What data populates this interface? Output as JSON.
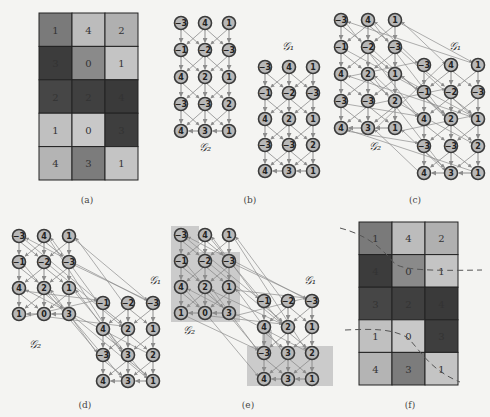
{
  "figure": {
    "captions": [
      "(a)",
      "(b)",
      "(c)",
      "(d)",
      "(e)",
      "(f)"
    ],
    "graph_labels": {
      "g1": "𝒢₁",
      "g2": "𝒢₂"
    }
  },
  "panel_a": {
    "caption": "(a)",
    "grid": [
      [
        1,
        4,
        2
      ],
      [
        3,
        0,
        1
      ],
      [
        2,
        2,
        4
      ],
      [
        1,
        0,
        3
      ],
      [
        4,
        3,
        1
      ]
    ],
    "shades": [
      [
        "#7a7a7a",
        "#bcbcbc",
        "#b0b0b0"
      ],
      [
        "#3c3c3c",
        "#8a8a8a",
        "#c4c4c4"
      ],
      [
        "#464646",
        "#404040",
        "#3a3a3a"
      ],
      [
        "#c0c0c0",
        "#c8c8c8",
        "#3e3e3e"
      ],
      [
        "#b4b4b4",
        "#7c7c7c",
        "#c4c4c4"
      ]
    ]
  },
  "panel_b": {
    "caption": "(b)",
    "g2_nodes": [
      [
        "-3",
        "4",
        "1"
      ],
      [
        "-1",
        "-2",
        "-3"
      ],
      [
        "4",
        "2",
        "1"
      ],
      [
        "-3",
        "-3",
        "2"
      ],
      [
        "4",
        "3",
        "1"
      ]
    ],
    "g1_nodes": [
      [
        "-3",
        "4",
        "1"
      ],
      [
        "-1",
        "-2",
        "-3"
      ],
      [
        "4",
        "2",
        "1"
      ],
      [
        "-3",
        "-3",
        "2"
      ],
      [
        "4",
        "3",
        "1"
      ]
    ]
  },
  "panel_c": {
    "caption": "(c)",
    "g2_nodes": [
      [
        "-3",
        "4",
        "1"
      ],
      [
        "-1",
        "-2",
        "-3"
      ],
      [
        "4",
        "2",
        "1"
      ],
      [
        "-3",
        "-3",
        "2"
      ],
      [
        "4",
        "3",
        "1"
      ]
    ],
    "g1_nodes": [
      [
        "-3",
        "4",
        "1"
      ],
      [
        "-1",
        "-2",
        "-3"
      ],
      [
        "4",
        "2",
        "1"
      ],
      [
        "-3",
        "-3",
        "2"
      ],
      [
        "4",
        "3",
        "1"
      ]
    ]
  },
  "panel_d": {
    "caption": "(d)",
    "g2_nodes": [
      [
        "-3",
        "4",
        "1"
      ],
      [
        "-1",
        "-2",
        "-3"
      ],
      [
        "4",
        "2",
        "1"
      ],
      [
        "1",
        "0",
        "3"
      ]
    ],
    "g1_nodes": [
      [
        "-1",
        "-2",
        "-3"
      ],
      [
        "4",
        "2",
        "1"
      ],
      [
        "-3",
        "3",
        "2"
      ],
      [
        "4",
        "3",
        "1"
      ]
    ]
  },
  "panel_e": {
    "caption": "(e)",
    "g2_nodes": [
      [
        "-3",
        "4",
        "1"
      ],
      [
        "-1",
        "-2",
        "-3"
      ],
      [
        "4",
        "2",
        "1"
      ],
      [
        "1",
        "0",
        "3"
      ]
    ],
    "g1_nodes": [
      [
        "-1",
        "-2",
        "-3"
      ],
      [
        "4",
        "2",
        "1"
      ],
      [
        "-3",
        "3",
        "2"
      ],
      [
        "4",
        "3",
        "1"
      ]
    ],
    "highlight_color": "#c4c4c4"
  },
  "panel_f": {
    "caption": "(f)",
    "grid": [
      [
        1,
        4,
        2
      ],
      [
        4,
        0,
        1
      ],
      [
        3,
        2,
        4
      ],
      [
        1,
        0,
        3
      ],
      [
        4,
        3,
        1
      ]
    ],
    "shades": [
      [
        "#7a7a7a",
        "#bcbcbc",
        "#b0b0b0"
      ],
      [
        "#3c3c3c",
        "#8a8a8a",
        "#c4c4c4"
      ],
      [
        "#464646",
        "#404040",
        "#3a3a3a"
      ],
      [
        "#c0c0c0",
        "#c8c8c8",
        "#3e3e3e"
      ],
      [
        "#b4b4b4",
        "#7c7c7c",
        "#c4c4c4"
      ]
    ]
  },
  "colors": {
    "node_fill": "#b8b8b8",
    "node_stroke": "#3a3a3a",
    "edge": "#8c8c8c",
    "grid_line": "#222222",
    "dashed_cut": "#555555"
  }
}
